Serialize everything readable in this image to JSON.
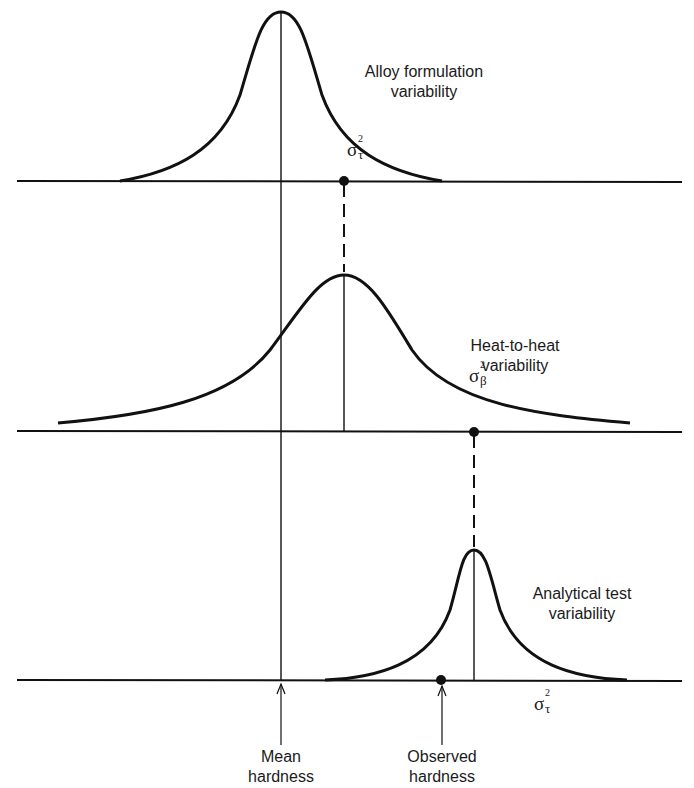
{
  "diagram": {
    "panels": [
      {
        "id": "alloy",
        "label_line1": "Alloy formulation",
        "label_line2": "variability",
        "sigma_base": "σ",
        "sigma_sup": "2",
        "sigma_sub": "τ",
        "curve_center_x": 281,
        "baseline_y": 181,
        "peak_y": 12,
        "sampled_point_x": 344
      },
      {
        "id": "heat",
        "label_line1": "Heat-to-heat",
        "label_line2": "variability",
        "sigma_base": "σ",
        "sigma_sup": "2",
        "sigma_sub": "β",
        "curve_center_x": 344,
        "baseline_y": 431,
        "peak_y": 275,
        "sampled_point_x": 474
      },
      {
        "id": "analytical",
        "label_line1": "Analytical test",
        "label_line2": "variability",
        "sigma_base": "σ",
        "sigma_sup": "2",
        "sigma_sub": "τ",
        "curve_center_x": 474,
        "baseline_y": 680,
        "peak_y": 550,
        "sampled_point_x": 441
      }
    ],
    "bottom_labels": {
      "mean_line1": "Mean",
      "mean_line2": "hardness",
      "observed_line1": "Observed",
      "observed_line2": "hardness"
    },
    "colors": {
      "ink": "#111111",
      "background": "#ffffff"
    }
  }
}
